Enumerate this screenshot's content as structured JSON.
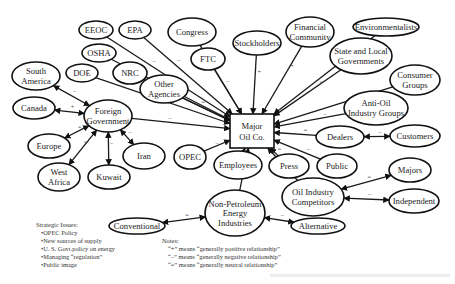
{
  "center": {
    "id": "major",
    "label_lines": [
      "Major",
      "Oil Co."
    ]
  },
  "nodes": [
    {
      "id": "eeoc",
      "lines": [
        "EEOC"
      ],
      "x": 96,
      "y": 30,
      "rx": 17,
      "ry": 9
    },
    {
      "id": "epa",
      "lines": [
        "EPA"
      ],
      "x": 135,
      "y": 30,
      "rx": 16,
      "ry": 9
    },
    {
      "id": "congress",
      "lines": [
        "Congress"
      ],
      "x": 192,
      "y": 32,
      "rx": 24,
      "ry": 14
    },
    {
      "id": "stockholders",
      "lines": [
        "Stockholders"
      ],
      "x": 257,
      "y": 43,
      "rx": 24,
      "ry": 12
    },
    {
      "id": "financial",
      "lines": [
        "Financial",
        "Community"
      ],
      "x": 310,
      "y": 32,
      "rx": 24,
      "ry": 15
    },
    {
      "id": "environmentalists",
      "lines": [
        "Environmentalists"
      ],
      "x": 386,
      "y": 27,
      "rx": 33,
      "ry": 9
    },
    {
      "id": "statelocal",
      "lines": [
        "State and Local",
        "Governments"
      ],
      "x": 361,
      "y": 56,
      "rx": 31,
      "ry": 18
    },
    {
      "id": "consumer",
      "lines": [
        "Consumer",
        "Groups"
      ],
      "x": 415,
      "y": 80,
      "rx": 25,
      "ry": 15
    },
    {
      "id": "antioil",
      "lines": [
        "Anti-Oil",
        "Industry Groups"
      ],
      "x": 376,
      "y": 108,
      "rx": 32,
      "ry": 17
    },
    {
      "id": "dealers",
      "lines": [
        "Dealers"
      ],
      "x": 340,
      "y": 137,
      "rx": 24,
      "ry": 11
    },
    {
      "id": "customers",
      "lines": [
        "Customers"
      ],
      "x": 415,
      "y": 136,
      "rx": 25,
      "ry": 11
    },
    {
      "id": "osha",
      "lines": [
        "OSHA"
      ],
      "x": 99,
      "y": 53,
      "rx": 17,
      "ry": 9
    },
    {
      "id": "ftc",
      "lines": [
        "FTC"
      ],
      "x": 208,
      "y": 59,
      "rx": 17,
      "ry": 11
    },
    {
      "id": "southamerica",
      "lines": [
        "South",
        "America"
      ],
      "x": 36,
      "y": 76,
      "rx": 24,
      "ry": 14
    },
    {
      "id": "doe",
      "lines": [
        "DOE"
      ],
      "x": 82,
      "y": 73,
      "rx": 16,
      "ry": 9
    },
    {
      "id": "nrc",
      "lines": [
        "NRC"
      ],
      "x": 130,
      "y": 73,
      "rx": 17,
      "ry": 11
    },
    {
      "id": "other",
      "lines": [
        "Other",
        "Agencies"
      ],
      "x": 164,
      "y": 89,
      "rx": 24,
      "ry": 14
    },
    {
      "id": "canada",
      "lines": [
        "Canada"
      ],
      "x": 34,
      "y": 108,
      "rx": 21,
      "ry": 11
    },
    {
      "id": "foreign",
      "lines": [
        "Foreign",
        "Government"
      ],
      "x": 108,
      "y": 116,
      "rx": 24,
      "ry": 16
    },
    {
      "id": "europe",
      "lines": [
        "Europe"
      ],
      "x": 49,
      "y": 146,
      "rx": 21,
      "ry": 12
    },
    {
      "id": "westafrica",
      "lines": [
        "West",
        "Africa"
      ],
      "x": 59,
      "y": 177,
      "rx": 21,
      "ry": 14
    },
    {
      "id": "kuwait",
      "lines": [
        "Kuwait"
      ],
      "x": 109,
      "y": 177,
      "rx": 21,
      "ry": 12
    },
    {
      "id": "iran",
      "lines": [
        "Iran"
      ],
      "x": 144,
      "y": 156,
      "rx": 21,
      "ry": 13
    },
    {
      "id": "opec",
      "lines": [
        "OPEC"
      ],
      "x": 190,
      "y": 157,
      "rx": 16,
      "ry": 12
    },
    {
      "id": "employees",
      "lines": [
        "Employees"
      ],
      "x": 238,
      "y": 165,
      "rx": 24,
      "ry": 14
    },
    {
      "id": "press",
      "lines": [
        "Press"
      ],
      "x": 289,
      "y": 166,
      "rx": 20,
      "ry": 12
    },
    {
      "id": "public",
      "lines": [
        "Public"
      ],
      "x": 337,
      "y": 166,
      "rx": 20,
      "ry": 12
    },
    {
      "id": "majors",
      "lines": [
        "Majors"
      ],
      "x": 410,
      "y": 170,
      "rx": 21,
      "ry": 12
    },
    {
      "id": "competitors",
      "lines": [
        "Oil Industry",
        "Competitors"
      ],
      "x": 313,
      "y": 197,
      "rx": 31,
      "ry": 19
    },
    {
      "id": "independent",
      "lines": [
        "Independent"
      ],
      "x": 414,
      "y": 201,
      "rx": 25,
      "ry": 12
    },
    {
      "id": "nonpetro",
      "lines": [
        "Non-Petroleum",
        "Energy",
        "Industries"
      ],
      "x": 235,
      "y": 213,
      "rx": 30,
      "ry": 23
    },
    {
      "id": "conventional",
      "lines": [
        "Conventional"
      ],
      "x": 137,
      "y": 226,
      "rx": 28,
      "ry": 8
    },
    {
      "id": "alternative",
      "lines": [
        "Alternative"
      ],
      "x": 318,
      "y": 226,
      "rx": 27,
      "ry": 8
    }
  ],
  "edges": [
    {
      "from": "eeoc",
      "sign": "–"
    },
    {
      "from": "epa",
      "sign": "–"
    },
    {
      "from": "osha",
      "sign": "–"
    },
    {
      "from": "congress",
      "sign": "–"
    },
    {
      "from": "ftc",
      "sign": "–"
    },
    {
      "from": "stockholders",
      "sign": "+"
    },
    {
      "from": "financial",
      "sign": "+"
    },
    {
      "from": "environmentalists",
      "sign": "–"
    },
    {
      "from": "statelocal",
      "sign": "="
    },
    {
      "from": "consumer",
      "sign": "–"
    },
    {
      "from": "antioil",
      "sign": "–"
    },
    {
      "from": "dealers",
      "sign": "="
    },
    {
      "from": "doe",
      "sign": "–"
    },
    {
      "from": "nrc",
      "sign": "–"
    },
    {
      "from": "other",
      "sign": "="
    },
    {
      "from": "foreign",
      "sign": "–"
    },
    {
      "from": "opec",
      "sign": "–"
    },
    {
      "from": "employees",
      "sign": "+"
    },
    {
      "from": "press",
      "sign": "="
    },
    {
      "from": "public",
      "sign": "–"
    },
    {
      "from": "competitors",
      "sign": ""
    },
    {
      "from": "nonpetro",
      "sign": ""
    }
  ],
  "sub_edges": [
    {
      "a": "dealers",
      "b": "customers",
      "sign": "–"
    },
    {
      "a": "foreign",
      "b": "southamerica",
      "sign": "–"
    },
    {
      "a": "foreign",
      "b": "canada",
      "sign": "+"
    },
    {
      "a": "foreign",
      "b": "europe",
      "sign": "="
    },
    {
      "a": "foreign",
      "b": "westafrica",
      "sign": "="
    },
    {
      "a": "foreign",
      "b": "kuwait",
      "sign": "–"
    },
    {
      "a": "foreign",
      "b": "iran",
      "sign": "–"
    },
    {
      "a": "competitors",
      "b": "majors",
      "sign": "="
    },
    {
      "a": "competitors",
      "b": "independent",
      "sign": "–"
    },
    {
      "a": "nonpetro",
      "b": "conventional",
      "sign": "="
    },
    {
      "a": "nonpetro",
      "b": "alternative",
      "sign": "–"
    }
  ],
  "strategic_issues": {
    "title": "Strategic Issues:",
    "items": [
      "OPEC Policy",
      "New sources of supply",
      "U. S. Govt.policy on energy",
      "Managing “regulation”",
      "Public image"
    ]
  },
  "notes": {
    "title": "Notes:",
    "items": [
      "“+” means “generally positive relationship”",
      "“–” means “generally negative relationship”",
      "“=” means “generally neutral relationship”"
    ]
  }
}
